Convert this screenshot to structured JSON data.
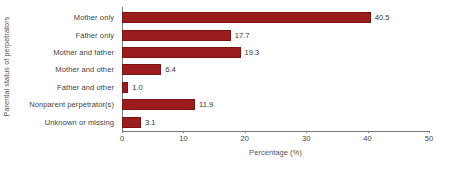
{
  "chart_data": {
    "type": "bar",
    "orientation": "horizontal",
    "title": "",
    "xlabel": "Percentage (%)",
    "ylabel": "Parental status of perpetrators",
    "categories": [
      "Mother only",
      "Father only",
      "Mother and father",
      "Mother and other",
      "Father and other",
      "Nonparent perpetrator(s)",
      "Unknown or missing"
    ],
    "values": [
      40.5,
      17.7,
      19.3,
      6.4,
      1.0,
      11.9,
      3.1
    ],
    "value_labels": [
      "40.5",
      "17.7",
      "19.3",
      "6.4",
      "1.0",
      "11.9",
      "3.1"
    ],
    "xlim": [
      0,
      50
    ],
    "xticks": [
      0,
      10,
      20,
      30,
      40,
      50
    ],
    "xtick_labels": [
      "0",
      "10",
      "20",
      "30",
      "40",
      "50"
    ],
    "grid": false,
    "legend": null,
    "bar_color": "#9b1c1c",
    "axis_color": "#7a7a7a",
    "text_color": "#444444",
    "background": "#ffffff"
  }
}
